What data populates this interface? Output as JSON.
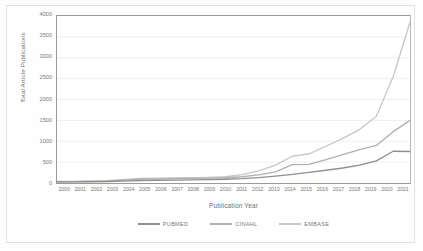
{
  "figure": {
    "background": "#fefefe",
    "frame_color": "#e2e2e2"
  },
  "chart_data": {
    "type": "line",
    "title": "",
    "xlabel": "Publication Year",
    "ylabel": "Total Article Publications",
    "ylim": [
      0,
      4000
    ],
    "ytick_labels": [
      "4000",
      "3500",
      "3000",
      "2500",
      "2000",
      "1500",
      "1000",
      "500",
      "0"
    ],
    "yticks": [
      4000,
      3500,
      3000,
      2500,
      2000,
      1500,
      1000,
      500,
      0
    ],
    "grid": "horizontal",
    "legend_position": "bottom",
    "categories": [
      "2000",
      "2001",
      "2002",
      "2003",
      "2004",
      "2005",
      "2006",
      "2007",
      "2008",
      "2009",
      "2010",
      "2011",
      "2012",
      "2013",
      "2014",
      "2015",
      "2016",
      "2017",
      "2018",
      "2019",
      "2020",
      "2021"
    ],
    "x": [
      2000,
      2001,
      2002,
      2003,
      2004,
      2005,
      2006,
      2007,
      2008,
      2009,
      2010,
      2011,
      2012,
      2013,
      2014,
      2015,
      2016,
      2017,
      2018,
      2019,
      2020,
      2021
    ],
    "series": [
      {
        "name": "PUBMED",
        "color": "#8f8f8f",
        "values": [
          25,
          28,
          30,
          35,
          45,
          60,
          65,
          70,
          75,
          80,
          90,
          105,
          130,
          165,
          205,
          255,
          305,
          360,
          430,
          530,
          760,
          755
        ]
      },
      {
        "name": "CINAHL",
        "color": "#b0b0b0",
        "values": [
          30,
          33,
          38,
          45,
          70,
          95,
          100,
          105,
          110,
          115,
          125,
          150,
          195,
          265,
          440,
          445,
          560,
          680,
          800,
          900,
          1230,
          1500
        ]
      },
      {
        "name": "EMBASE",
        "color": "#c8c8c8",
        "values": [
          35,
          40,
          48,
          58,
          85,
          110,
          118,
          122,
          128,
          135,
          150,
          200,
          290,
          430,
          640,
          700,
          880,
          1070,
          1280,
          1600,
          2550,
          3850
        ]
      }
    ]
  },
  "legend": {
    "items": [
      {
        "label": "PUBMED",
        "color": "#8f8f8f"
      },
      {
        "label": "CINAHL",
        "color": "#b0b0b0"
      },
      {
        "label": "EMBASE",
        "color": "#c8c8c8"
      }
    ]
  }
}
